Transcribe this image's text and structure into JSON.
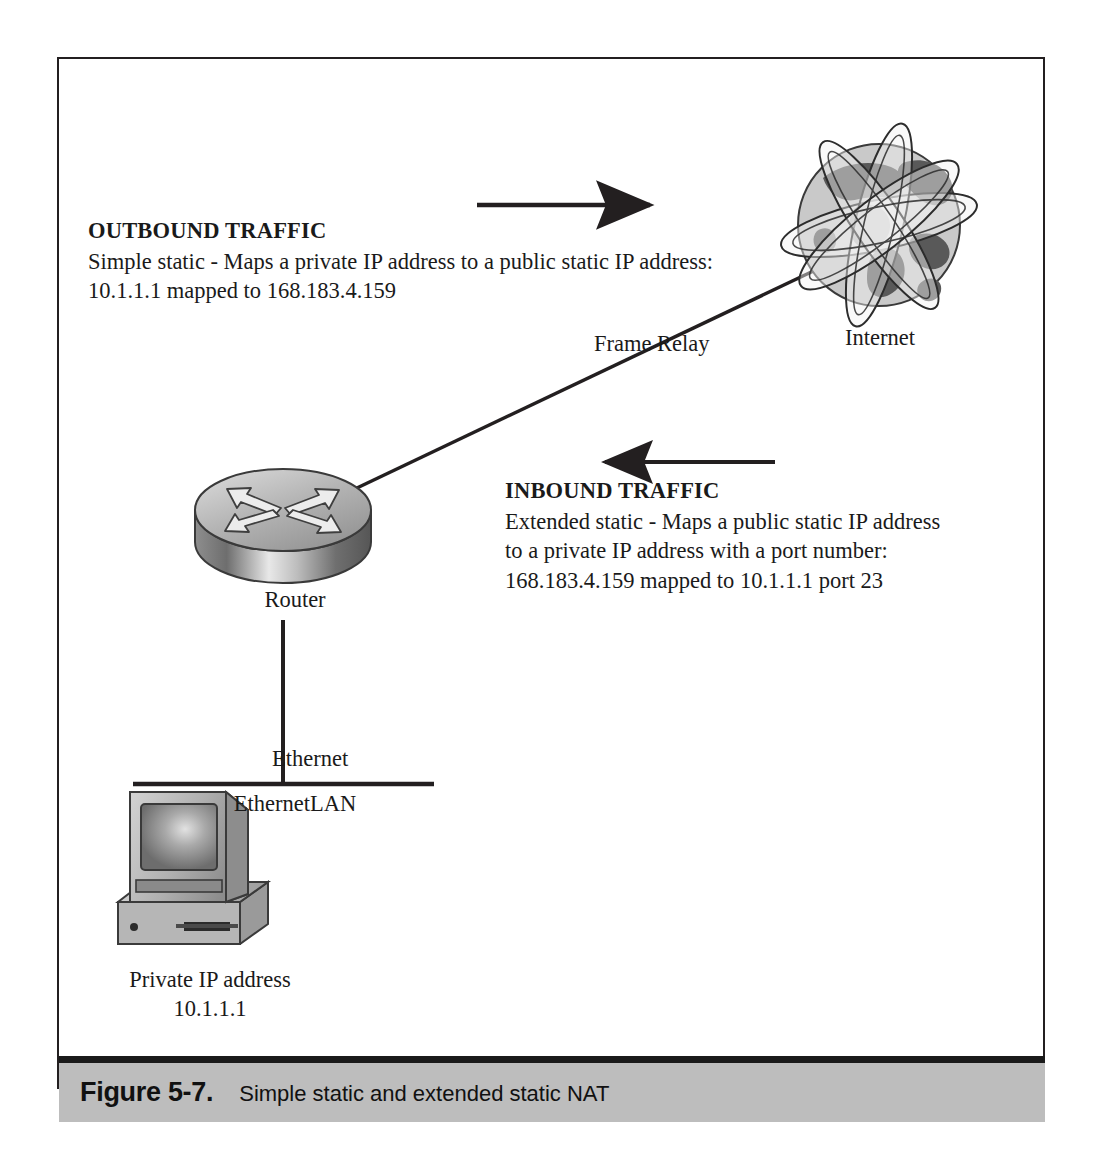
{
  "figure": {
    "caption_label": "Figure 5-7.",
    "caption_text": "Simple static and extended static NAT"
  },
  "diagram": {
    "outbound": {
      "title": "OUTBOUND TRAFFIC",
      "line1": "Simple static - Maps a private IP address to a public static IP address:",
      "line2": "10.1.1.1 mapped to 168.183.4.159"
    },
    "inbound": {
      "title": "INBOUND TRAFFIC",
      "line1": "Extended static - Maps a public static IP address",
      "line2": "to a private IP address with a port number:",
      "line3": "168.183.4.159 mapped to 10.1.1.1 port 23"
    },
    "nodes": {
      "internet": "Internet",
      "router": "Router",
      "lan": "EthernetLAN",
      "pc_label_line1": "Private IP address",
      "pc_label_line2": "10.1.1.1"
    },
    "links": {
      "frame_relay": "Frame Relay",
      "ethernet": "Ethernet"
    },
    "colors": {
      "ink": "#231f20",
      "globe_land": "#595959",
      "globe_ocean": "#c9c9c9",
      "device_gray": "#a8a8a8",
      "caption_band": "#bdbdbd"
    }
  }
}
